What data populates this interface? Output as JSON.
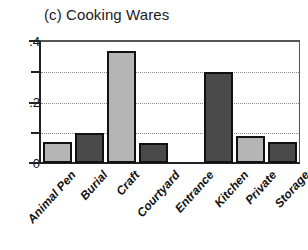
{
  "chart_data": {
    "type": "bar",
    "title": "(c) Cooking Wares",
    "xlabel": "",
    "ylabel": "",
    "categories": [
      "Animal Pen",
      "Burial",
      "Craft",
      "Courtyard",
      "Entrance",
      "Kitchen",
      "Private",
      "Storage"
    ],
    "values": [
      0.07,
      0.1,
      0.37,
      0.065,
      0.0,
      0.3,
      0.09,
      0.07
    ],
    "bar_colors": [
      "#b5b5b5",
      "#4a4a4a",
      "#b5b5b5",
      "#4a4a4a",
      "none",
      "#4a4a4a",
      "#b5b5b5",
      "#4a4a4a"
    ],
    "ylim": [
      0,
      0.4
    ],
    "ytick_values": [
      0,
      0.1,
      0.2,
      0.3,
      0.4
    ],
    "ytick_labels": [
      "0",
      "",
      ".2",
      "",
      ".4"
    ],
    "gridlines": [
      0.1,
      0.2,
      0.3
    ],
    "grid": true,
    "legend": "none",
    "axis_color": "#111111",
    "grid_color": "#8a8a8a"
  },
  "axis": {
    "y_label_top": ".4",
    "y_label_mid": ".2",
    "y_label_bottom": "0"
  },
  "xaxis": {
    "labels": [
      "Animal Pen",
      "Burial",
      "Craft",
      "Courtyard",
      "Entrance",
      "Kitchen",
      "Private",
      "Storage"
    ]
  }
}
